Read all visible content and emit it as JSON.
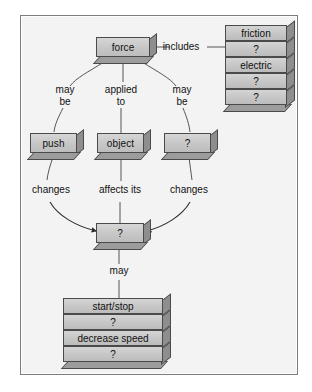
{
  "diagram": {
    "background_color": "#f3f3f3",
    "box_face_color": "#c9c9c9",
    "box_side_color": "#8e8e8e",
    "outline_color": "#4a4a4a",
    "root": {
      "label": "force"
    },
    "includes_label": "includes",
    "includes_stack": [
      {
        "label": "friction"
      },
      {
        "label": "?"
      },
      {
        "label": "electric"
      },
      {
        "label": "?"
      },
      {
        "label": "?"
      }
    ],
    "branch_labels": {
      "left": "may\nbe",
      "center": "applied\nto",
      "right": "may\nbe"
    },
    "middle_nodes": [
      {
        "label": "push"
      },
      {
        "label": "object"
      },
      {
        "label": "?"
      }
    ],
    "relation_labels": {
      "left": "changes",
      "center": "affects its",
      "right": "changes"
    },
    "converge_node": {
      "label": "?"
    },
    "may_label": "may",
    "outcome_stack": [
      {
        "label": "start/stop"
      },
      {
        "label": "?"
      },
      {
        "label": "decrease speed"
      },
      {
        "label": "?"
      }
    ]
  }
}
